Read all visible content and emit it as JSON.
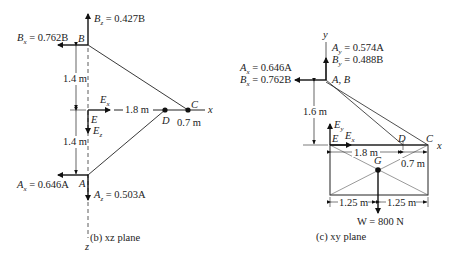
{
  "left_panel": {
    "caption": "(b) xz plane",
    "axis_x": "x",
    "axis_z": "z",
    "points": {
      "B": "B",
      "E": "E",
      "D": "D",
      "C": "C",
      "A": "A"
    },
    "forces": {
      "Bz": {
        "sym": "B",
        "sub": "z",
        "val": " = 0.427B"
      },
      "Bx": {
        "sym": "B",
        "sub": "x",
        "val": " = 0.762B"
      },
      "Ex": {
        "sym": "E",
        "sub": "x"
      },
      "Ez": {
        "sym": "E",
        "sub": "z"
      },
      "Ax": {
        "sym": "A",
        "sub": "x",
        "val": " = 0.646A"
      },
      "Az": {
        "sym": "A",
        "sub": "z",
        "val": " = 0.503A"
      }
    },
    "dims": {
      "BE": "1.4 m",
      "EA": "1.4 m",
      "ED": "1.8 m",
      "DC": "0.7 m"
    }
  },
  "right_panel": {
    "caption": "(c) xy plane",
    "axis_x": "x",
    "axis_y": "y",
    "points": {
      "AB": "A, B",
      "E": "E",
      "D": "D",
      "C": "C",
      "G": "G"
    },
    "forces": {
      "Ay": {
        "sym": "A",
        "sub": "y",
        "val": " = 0.574A"
      },
      "By": {
        "sym": "B",
        "sub": "y",
        "val": " = 0.488B"
      },
      "Ax": {
        "sym": "A",
        "sub": "x",
        "val": " = 0.646A"
      },
      "Bx": {
        "sym": "B",
        "sub": "x",
        "val": " = 0.762B"
      },
      "Ey": {
        "sym": "E",
        "sub": "y"
      },
      "Ex": {
        "sym": "E",
        "sub": "x"
      },
      "W": "W = 800 N"
    },
    "dims": {
      "height": "1.6 m",
      "ED": "1.8 m",
      "DC": "0.7 m",
      "half1": "1.25 m",
      "half2": "1.25 m"
    }
  }
}
